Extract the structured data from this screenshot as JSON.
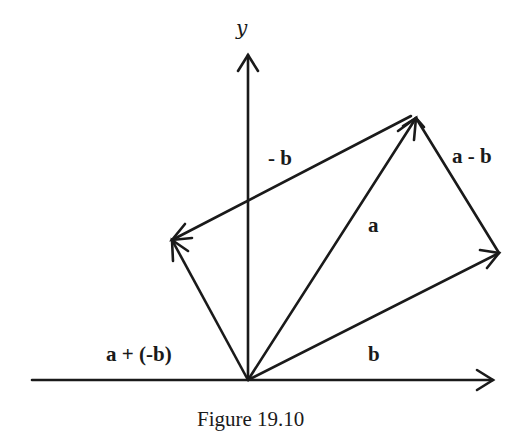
{
  "figure": {
    "caption": "Figure 19.10",
    "axes": {
      "y_label": "y",
      "origin": [
        248,
        380
      ],
      "x_axis": {
        "from": [
          32,
          380
        ],
        "to": [
          493,
          380
        ]
      },
      "y_axis": {
        "from": [
          248,
          380
        ],
        "to": [
          248,
          55
        ]
      }
    },
    "vectors": [
      {
        "name": "a",
        "label": "a",
        "from": [
          248,
          380
        ],
        "to": [
          416,
          118
        ]
      },
      {
        "name": "b",
        "label": "b",
        "from": [
          248,
          380
        ],
        "to": [
          499,
          253
        ]
      },
      {
        "name": "neg-b",
        "label": "- b",
        "from": [
          411,
          116
        ],
        "to": [
          172,
          240
        ]
      },
      {
        "name": "a-minus-b",
        "label": "a - b",
        "from": [
          499,
          253
        ],
        "to": [
          416,
          118
        ]
      },
      {
        "name": "a-plus-neg-b",
        "label": "a + (-b)",
        "from": [
          248,
          380
        ],
        "to": [
          172,
          240
        ]
      }
    ],
    "colors": {
      "stroke": "#1a1a1a",
      "background": "#ffffff"
    }
  }
}
